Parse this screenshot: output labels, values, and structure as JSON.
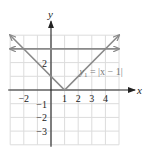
{
  "chart_data": {
    "type": "line",
    "title": "",
    "xlabel": "x",
    "ylabel": "y",
    "xlim": [
      -3,
      5
    ],
    "ylim": [
      -4,
      4
    ],
    "grid": true,
    "x_ticks": [
      -2,
      1,
      2,
      3,
      4
    ],
    "y_ticks": [
      2,
      -1,
      -2,
      -3
    ],
    "x_tick_labels": [
      "−2",
      "1",
      "2",
      "3",
      "4"
    ],
    "y_tick_labels": [
      "2",
      "−1",
      "−2",
      "−3"
    ],
    "series": [
      {
        "name": "y1 = |x − 1|",
        "kind": "absolute-value",
        "points": [
          [
            -3,
            4
          ],
          [
            1,
            0
          ],
          [
            5,
            4
          ]
        ],
        "color": "#8a8a8a",
        "arrows": "both"
      },
      {
        "name": "y = 3",
        "kind": "horizontal",
        "points": [
          [
            -3,
            3
          ],
          [
            5,
            3
          ]
        ],
        "color": "#8a8a8a",
        "arrows": "both"
      }
    ],
    "annotations": [
      {
        "text_main": "y",
        "text_sub": "1",
        "text_rest": " = |x − 1|",
        "x": 2.9,
        "y": 1.1
      }
    ]
  },
  "colors": {
    "grid": "#dcdcdc",
    "axis": "#222222",
    "curve": "#8a8a8a"
  }
}
